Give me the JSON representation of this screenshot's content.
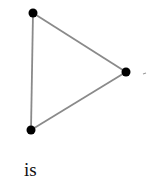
{
  "diagram": {
    "type": "graph",
    "vertices": [
      {
        "id": "A",
        "x": 33,
        "y": 13
      },
      {
        "id": "B",
        "x": 126,
        "y": 72
      },
      {
        "id": "C",
        "x": 31,
        "y": 130
      }
    ],
    "edges": [
      {
        "from": "A",
        "to": "B"
      },
      {
        "from": "B",
        "to": "C"
      },
      {
        "from": "C",
        "to": "A"
      }
    ],
    "edge_color": "#8a8a8a",
    "vertex_color": "#000000",
    "trailing_mark": "-",
    "caption": "is"
  }
}
